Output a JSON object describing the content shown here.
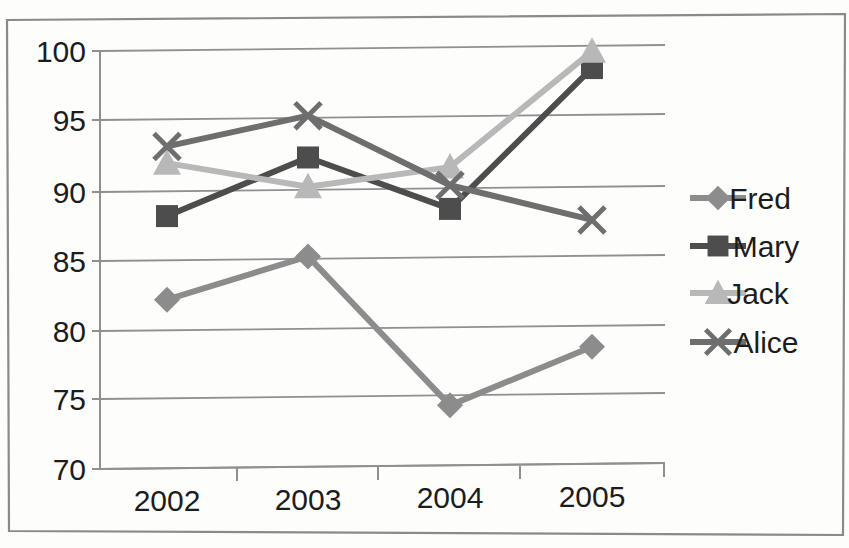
{
  "chart_data": {
    "type": "line",
    "title": "",
    "xlabel": "",
    "ylabel": "",
    "categories": [
      "2002",
      "2003",
      "2004",
      "2005"
    ],
    "ylim": [
      70,
      100
    ],
    "yticks": [
      70,
      75,
      80,
      85,
      90,
      95,
      100
    ],
    "ytick_labels": [
      "70",
      "75",
      "80",
      "85",
      "90",
      "95",
      "100"
    ],
    "grid": "horizontal",
    "legend_position": "right",
    "series": [
      {
        "name": "Fred",
        "marker": "diamond",
        "color": "#8c8c8c",
        "values": [
          82.1,
          85.1,
          74.3,
          78.4
        ]
      },
      {
        "name": "Mary",
        "marker": "square",
        "color": "#4d4d4d",
        "values": [
          88.1,
          92.2,
          88.4,
          98.4
        ]
      },
      {
        "name": "Jack",
        "marker": "triangle",
        "color": "#b8b8b8",
        "values": [
          91.9,
          90.1,
          91.4,
          99.6
        ]
      },
      {
        "name": "Alice",
        "marker": "x",
        "color": "#6e6e6e",
        "values": [
          93.1,
          95.2,
          90.1,
          87.5
        ]
      }
    ]
  },
  "axis": {
    "y_tick_0": "70",
    "y_tick_1": "75",
    "y_tick_2": "80",
    "y_tick_3": "85",
    "y_tick_4": "90",
    "y_tick_5": "95",
    "y_tick_6": "100",
    "x_tick_0": "2002",
    "x_tick_1": "2003",
    "x_tick_2": "2004",
    "x_tick_3": "2005"
  },
  "legend": {
    "items": [
      {
        "label": "Fred"
      },
      {
        "label": "Mary"
      },
      {
        "label": "Jack"
      },
      {
        "label": "Alice"
      }
    ]
  },
  "colors": {
    "frame": "#8a8a8a",
    "gridline": "#8f8f8f",
    "axis": "#8f8f8f",
    "text": "#1c1c1c",
    "background": "#fdfdfc"
  }
}
